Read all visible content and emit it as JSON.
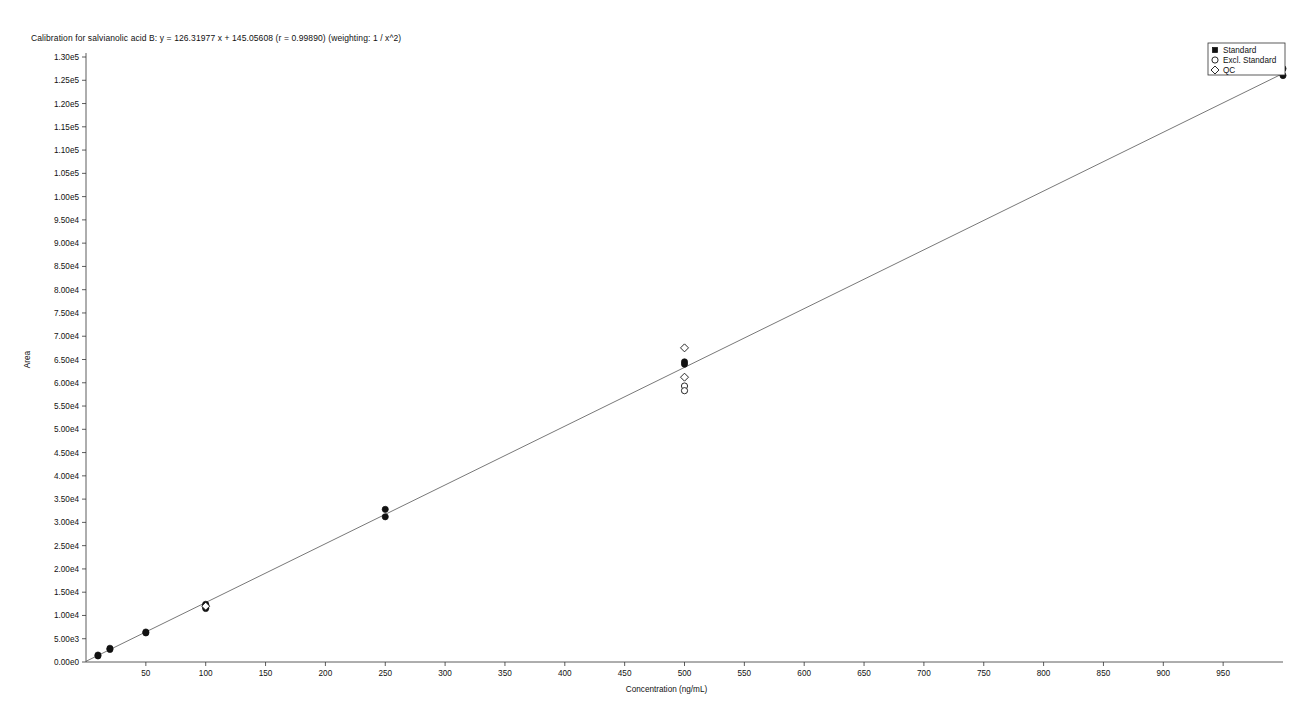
{
  "chart_data": {
    "type": "scatter",
    "title": "Calibration for salvianolic acid B:  y = 126.31977 x + 145.05608  (r = 0.99890)  (weighting: 1 / x^2)",
    "xlabel": "Concentration (ng/mL)",
    "ylabel": "Area",
    "xlim": [
      0,
      1000
    ],
    "ylim": [
      0,
      132000
    ],
    "grid": false,
    "legend_position": "top-right",
    "xticks": [
      50,
      100,
      150,
      200,
      250,
      300,
      350,
      400,
      450,
      500,
      550,
      600,
      650,
      700,
      750,
      800,
      850,
      900,
      950
    ],
    "xtick_labels": [
      "50",
      "100",
      "150",
      "200",
      "250",
      "300",
      "350",
      "400",
      "450",
      "500",
      "550",
      "600",
      "650",
      "700",
      "750",
      "800",
      "850",
      "900",
      "950"
    ],
    "yticks": [
      0,
      5000,
      10000,
      15000,
      20000,
      25000,
      30000,
      35000,
      40000,
      45000,
      50000,
      55000,
      60000,
      65000,
      70000,
      75000,
      80000,
      85000,
      90000,
      95000,
      100000,
      105000,
      110000,
      115000,
      120000,
      125000,
      130000
    ],
    "ytick_labels": [
      "0.00e0",
      "5.00e3",
      "1.00e4",
      "1.50e4",
      "2.00e4",
      "2.50e4",
      "3.00e4",
      "3.50e4",
      "4.00e4",
      "4.50e4",
      "5.00e4",
      "5.50e4",
      "6.00e4",
      "6.50e4",
      "7.00e4",
      "7.50e4",
      "8.00e4",
      "8.50e4",
      "9.00e4",
      "9.50e4",
      "1.00e5",
      "1.05e5",
      "1.10e5",
      "1.15e5",
      "1.20e5",
      "1.25e5",
      "1.30e5"
    ],
    "regression": {
      "slope": 126.31977,
      "intercept": 145.05608,
      "r": 0.9989,
      "weighting": "1 / x^2",
      "x_start": 0,
      "x_end": 1000
    },
    "legend": [
      {
        "label": "Standard",
        "marker": "filled-square"
      },
      {
        "label": "Excl. Standard",
        "marker": "open-circle"
      },
      {
        "label": "QC",
        "marker": "open-diamond"
      }
    ],
    "series": [
      {
        "name": "Standard",
        "marker": "filled-circle",
        "points": [
          {
            "x": 10,
            "y": 1500
          },
          {
            "x": 10,
            "y": 1300
          },
          {
            "x": 20,
            "y": 2950
          },
          {
            "x": 20,
            "y": 2700
          },
          {
            "x": 50,
            "y": 6450
          },
          {
            "x": 50,
            "y": 6250
          },
          {
            "x": 100,
            "y": 12400
          },
          {
            "x": 100,
            "y": 12100
          },
          {
            "x": 100,
            "y": 11800
          },
          {
            "x": 100,
            "y": 11500
          },
          {
            "x": 250,
            "y": 32800
          },
          {
            "x": 250,
            "y": 31200
          },
          {
            "x": 500,
            "y": 64500
          },
          {
            "x": 500,
            "y": 64000
          },
          {
            "x": 1000,
            "y": 127500
          },
          {
            "x": 1000,
            "y": 126000
          }
        ]
      },
      {
        "name": "Excl. Standard",
        "marker": "open-circle",
        "points": [
          {
            "x": 500,
            "y": 59300
          },
          {
            "x": 500,
            "y": 58300
          }
        ]
      },
      {
        "name": "QC",
        "marker": "open-diamond",
        "points": [
          {
            "x": 100,
            "y": 12000
          },
          {
            "x": 500,
            "y": 67500
          },
          {
            "x": 500,
            "y": 61200
          }
        ]
      }
    ]
  }
}
